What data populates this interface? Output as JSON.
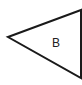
{
  "diagram": {
    "shape": "triangle-pointing-left",
    "label": "B",
    "stroke_color": "#1a1a1a",
    "fill_color": "#ffffff"
  }
}
